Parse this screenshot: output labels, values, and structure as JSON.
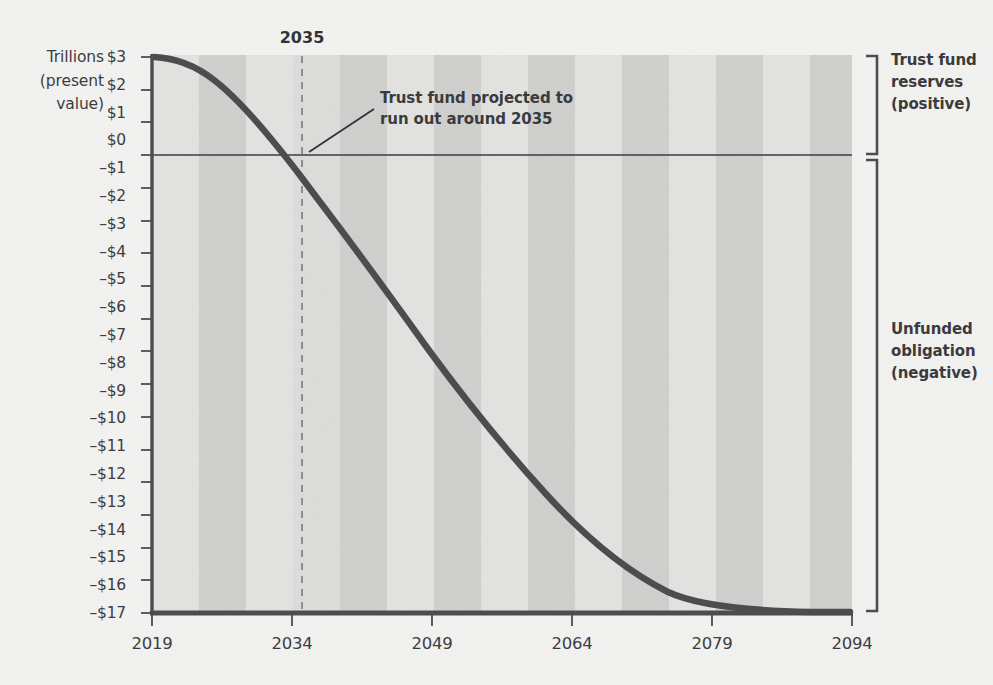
{
  "chart_data": {
    "type": "line",
    "title": "",
    "subtitle": "",
    "xlabel": "",
    "ylabel": "Trillions (present value)",
    "ylabel_lines": [
      "Trillions",
      "(present",
      "value)"
    ],
    "xlim": [
      2019,
      2094
    ],
    "ylim": [
      -17.3,
      3.0
    ],
    "grid": false,
    "legend_position": "none",
    "x_tick_labels": [
      "2019",
      "2034",
      "2049",
      "2064",
      "2079",
      "2094"
    ],
    "x_ticks": [
      2019,
      2034,
      2049,
      2064,
      2079,
      2094
    ],
    "y_tick_labels": [
      "$3",
      "$2",
      "$1",
      "$0",
      "–$1",
      "–$2",
      "–$3",
      "–$4",
      "–$5",
      "–$6",
      "–$7",
      "–$8",
      "–$9",
      "–$10",
      "–$11",
      "–$12",
      "–$13",
      "–$14",
      "–$15",
      "–$16",
      "–$17"
    ],
    "y_ticks": [
      3,
      2,
      1,
      0,
      -1,
      -2,
      -3,
      -4,
      -5,
      -6,
      -7,
      -8,
      -9,
      -10,
      -11,
      -12,
      -13,
      -14,
      -15,
      -16,
      -17
    ],
    "zero_reference_line": 0,
    "series": [
      {
        "name": "Cumulative trust fund balance (present value)",
        "color": "#4a4a4c",
        "x": [
          2019,
          2021,
          2023,
          2025,
          2027,
          2029,
          2031,
          2033,
          2035,
          2037,
          2039,
          2041,
          2043,
          2045,
          2047,
          2049,
          2051,
          2053,
          2055,
          2057,
          2059,
          2061,
          2063,
          2065,
          2067,
          2069,
          2071,
          2073,
          2075,
          2077,
          2079,
          2081,
          2083,
          2085,
          2087,
          2089,
          2091,
          2094
        ],
        "values": [
          2.9,
          2.85,
          2.7,
          2.45,
          2.12,
          1.72,
          1.25,
          0.7,
          0.0,
          -0.75,
          -1.55,
          -2.4,
          -3.25,
          -4.15,
          -5.05,
          -5.95,
          -6.85,
          -7.7,
          -8.55,
          -9.35,
          -10.1,
          -10.85,
          -11.55,
          -12.2,
          -12.85,
          -13.45,
          -14.0,
          -14.5,
          -14.95,
          -15.4,
          -15.8,
          -16.15,
          -16.5,
          -16.8,
          -17.0,
          -17.12,
          -17.18,
          -17.2
        ]
      }
    ],
    "markers": [
      {
        "name": "trust-fund-depletion",
        "type": "vertical-dashed-line",
        "x": 2035,
        "label": "2035",
        "color": "#8a8a8c"
      }
    ],
    "annotations": [
      {
        "name": "trust-fund-callout",
        "line1": "Trust fund projected to",
        "line2": "run out around 2035",
        "points_to_x": 2035,
        "points_to_y": 0
      }
    ],
    "brackets": [
      {
        "name": "trust-fund-reserves",
        "label_lines": [
          "Trust fund",
          "reserves",
          "(positive)"
        ],
        "range": [
          0,
          3
        ]
      },
      {
        "name": "unfunded-obligation",
        "label_lines": [
          "Unfunded",
          "obligation",
          "(negative)"
        ],
        "range": [
          -17.2,
          0
        ]
      }
    ],
    "band_color_light": "#e0e0de",
    "band_color_dark": "#cfcfcd",
    "background_color": "#f2f2f0",
    "axis_color": "#4a4a4c",
    "text_color": "#3a3a3c"
  },
  "axis": {
    "y_title_line1": "Trillions",
    "y_title_line2": "(present",
    "y_title_line3": "value)"
  },
  "marker": {
    "year_label": "2035"
  },
  "callout": {
    "line1": "Trust fund projected to",
    "line2": "run out around 2035"
  },
  "bracket_top": {
    "line1": "Trust fund",
    "line2": "reserves",
    "line3": "(positive)"
  },
  "bracket_bottom": {
    "line1": "Unfunded",
    "line2": "obligation",
    "line3": "(negative)"
  }
}
